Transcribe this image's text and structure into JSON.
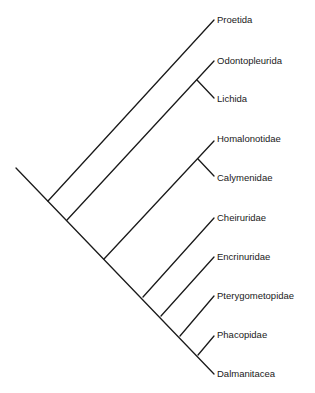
{
  "diagram": {
    "type": "cladogram",
    "line_color": "#1a1a1a",
    "taxa": [
      {
        "id": "proetida",
        "label": "Proetida"
      },
      {
        "id": "odontopleurida",
        "label": "Odontopleurida"
      },
      {
        "id": "lichida",
        "label": "Lichida"
      },
      {
        "id": "homalonotidae",
        "label": "Homalonotidae"
      },
      {
        "id": "calymenidae",
        "label": "Calymenidae"
      },
      {
        "id": "cheiruridae",
        "label": "Cheiruridae"
      },
      {
        "id": "encrinuridae",
        "label": "Encrinuridae"
      },
      {
        "id": "pterygometopidae",
        "label": "Pterygometopidae"
      },
      {
        "id": "phacopidae",
        "label": "Phacopidae"
      },
      {
        "id": "dalmanitacea",
        "label": "Dalmanitacea"
      }
    ],
    "topology": "(Proetida,((Odontopleurida,Lichida),((Homalonotidae,Calymenidae),(Cheiruridae,(Encrinuridae,(Pterygometopidae,(Phacopidae,Dalmanitacea)))))))"
  }
}
